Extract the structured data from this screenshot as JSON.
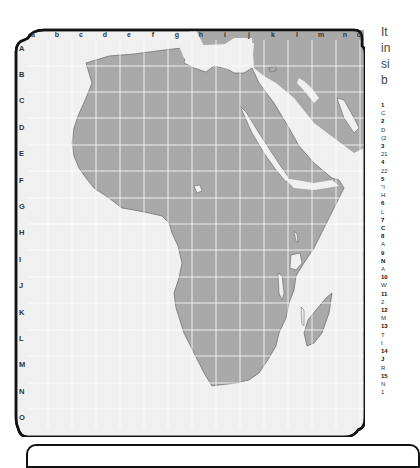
{
  "map": {
    "title": "Africa grid map",
    "columns": [
      "a",
      "b",
      "c",
      "d",
      "e",
      "f",
      "g",
      "h",
      "i",
      "j",
      "k",
      "l",
      "m",
      "n",
      "o"
    ],
    "rows": [
      "A",
      "B",
      "C",
      "D",
      "E",
      "F",
      "G",
      "H",
      "I",
      "J",
      "K",
      "L",
      "M",
      "N",
      "O"
    ],
    "colors": {
      "land": "#a9a9a9",
      "water": "#f0f0f0",
      "grid": "#ffffff",
      "border": "#111111"
    }
  },
  "side_text": {
    "intro_lines": [
      "It",
      "in",
      "si",
      "b"
    ],
    "list": [
      {
        "num": "1",
        "text": "C"
      },
      {
        "num": "2",
        "text": "D"
      },
      {
        "num": "",
        "text": "(2"
      },
      {
        "num": "3",
        "text": "21"
      },
      {
        "num": "4",
        "text": "22"
      },
      {
        "num": "5",
        "text": "\"I"
      },
      {
        "num": "",
        "text": "H"
      },
      {
        "num": "6",
        "text": "L"
      },
      {
        "num": "7",
        "text": "C"
      },
      {
        "num": "8",
        "text": "A"
      },
      {
        "num": "9",
        "text": "N"
      },
      {
        "num": "",
        "text": "A"
      },
      {
        "num": "10",
        "text": "W"
      },
      {
        "num": "11",
        "text": "2"
      },
      {
        "num": "12",
        "text": "M"
      },
      {
        "num": "13",
        "text": "T"
      },
      {
        "num": "",
        "text": "I"
      },
      {
        "num": "14",
        "text": "J"
      },
      {
        "num": "",
        "text": "R"
      },
      {
        "num": "15",
        "text": "N"
      },
      {
        "num": "",
        "text": "1"
      }
    ]
  }
}
